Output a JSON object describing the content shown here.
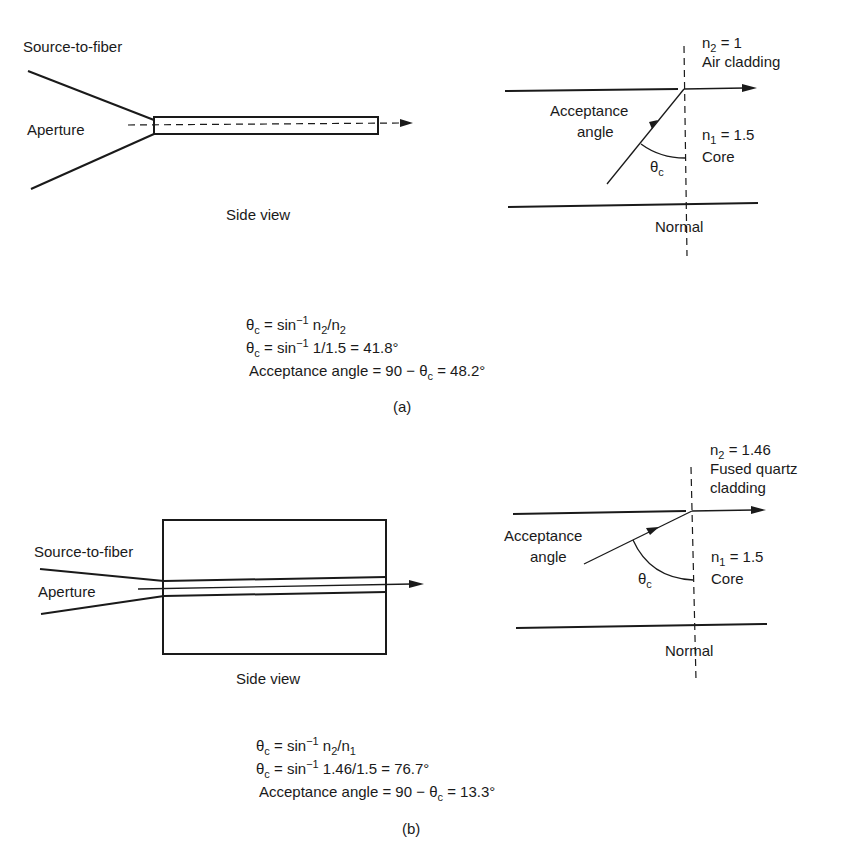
{
  "panel_a": {
    "side_view": {
      "label_source": "Source-to-fiber",
      "label_aperture": "Aperture",
      "caption": "Side view"
    },
    "interface": {
      "n2_symbol": "n",
      "n2_sub": "2",
      "n2_value": " = 1",
      "cladding": "Air cladding",
      "acceptance_line1": "Acceptance",
      "acceptance_line2": "angle",
      "n1_symbol": "n",
      "n1_sub": "1",
      "n1_value": " = 1.5",
      "core": "Core",
      "theta": "θ",
      "theta_sub": "c",
      "normal": "Normal"
    },
    "equations": {
      "eq1_lhs": "θ",
      "eq1_sub": "c",
      "eq1_mid": " = sin",
      "eq1_sup": "−1",
      "eq1_rhs_a": " n",
      "eq1_rhs_sub_a": "2",
      "eq1_rhs_b": "/n",
      "eq1_rhs_sub_b": "1",
      "eq2_rhs": " 1/1.5 = 41.8°",
      "eq3_text": "Acceptance angle = 90 − θ",
      "eq3_tail": " = 48.2°"
    },
    "caption": "(a)"
  },
  "panel_b": {
    "side_view": {
      "label_source": "Source-to-fiber",
      "label_aperture": "Aperture",
      "caption": "Side view"
    },
    "interface": {
      "n2_symbol": "n",
      "n2_sub": "2",
      "n2_value": " = 1.46",
      "cladding_line1": "Fused quartz",
      "cladding_line2": "cladding",
      "acceptance_line1": "Acceptance",
      "acceptance_line2": "angle",
      "n1_symbol": "n",
      "n1_sub": "1",
      "n1_value": " = 1.5",
      "core": "Core",
      "theta": "θ",
      "theta_sub": "c",
      "normal": "Normal"
    },
    "equations": {
      "eq1_lhs": "θ",
      "eq1_sub": "c",
      "eq1_mid": " = sin",
      "eq1_sup": "−1",
      "eq1_rhs_a": " n",
      "eq1_rhs_sub_a": "2",
      "eq1_rhs_b": "/n",
      "eq1_rhs_sub_b": "1",
      "eq2_rhs": " 1.46/1.5 = 76.7°",
      "eq3_text": "Acceptance angle = 90 − θ",
      "eq3_tail": " = 13.3°"
    },
    "caption": "(b)"
  }
}
